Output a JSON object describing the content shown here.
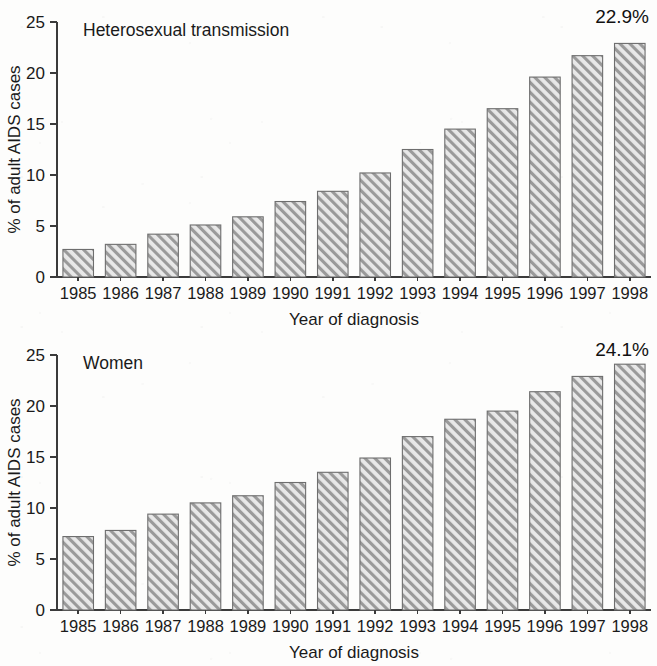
{
  "figure": {
    "background_color": "#fdfdfc",
    "bar_fill_color": "#e8e8e8",
    "bar_hatch_color": "#8c8c8c",
    "bar_edge_color": "#6e6e6e",
    "axis_color": "#3b3b3b",
    "text_color": "#1a1a1a"
  },
  "chart_data": [
    {
      "type": "bar",
      "id": "heterosexual-transmission",
      "title": "Heterosexual transmission",
      "xlabel": "Year of diagnosis",
      "ylabel": "% of adult AIDS cases",
      "ylim": [
        0,
        25
      ],
      "yticks": [
        0,
        5,
        10,
        15,
        20,
        25
      ],
      "ytick_labels": [
        "0",
        "5",
        "10",
        "15",
        "20",
        "25"
      ],
      "grid": false,
      "legend": "none",
      "hatch": "/",
      "categories": [
        "1985",
        "1986",
        "1987",
        "1988",
        "1989",
        "1990",
        "1991",
        "1992",
        "1993",
        "1994",
        "1995",
        "1996",
        "1997",
        "1998"
      ],
      "values": [
        2.7,
        3.2,
        4.2,
        5.1,
        5.9,
        7.4,
        8.4,
        10.2,
        12.5,
        14.5,
        16.5,
        19.6,
        21.7,
        22.9
      ],
      "annotation": {
        "text": "22.9%",
        "target_category": "1998"
      }
    },
    {
      "type": "bar",
      "id": "women",
      "title": "Women",
      "xlabel": "Year of diagnosis",
      "ylabel": "% of adult AIDS cases",
      "ylim": [
        0,
        25
      ],
      "yticks": [
        0,
        5,
        10,
        15,
        20,
        25
      ],
      "ytick_labels": [
        "0",
        "5",
        "10",
        "15",
        "20",
        "25"
      ],
      "grid": false,
      "legend": "none",
      "hatch": "/",
      "categories": [
        "1985",
        "1986",
        "1987",
        "1988",
        "1989",
        "1990",
        "1991",
        "1992",
        "1993",
        "1994",
        "1995",
        "1996",
        "1997",
        "1998"
      ],
      "values": [
        7.2,
        7.8,
        9.4,
        10.5,
        11.2,
        12.5,
        13.5,
        14.9,
        17.0,
        18.7,
        19.5,
        21.4,
        22.9,
        24.1
      ],
      "annotation": {
        "text": "24.1%",
        "target_category": "1998"
      }
    }
  ]
}
